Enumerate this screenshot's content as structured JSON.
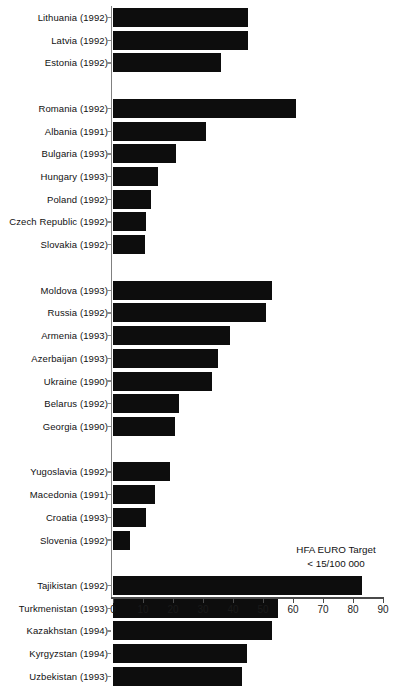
{
  "chart_data": {
    "type": "bar",
    "orientation": "horizontal",
    "title": "",
    "xlabel": "",
    "ylabel": "",
    "xlim": [
      0,
      90
    ],
    "xticks": [
      0,
      10,
      20,
      30,
      40,
      50,
      60,
      70,
      80,
      90
    ],
    "grid": false,
    "legend": "none",
    "bar_color": "#0d0d0d",
    "categories": [
      "Lithuania (1992)",
      "Latvia (1992)",
      "Estonia (1992)",
      "Romania (1992)",
      "Albania (1991)",
      "Bulgaria (1993)",
      "Hungary (1993)",
      "Poland (1992)",
      "Czech Republic (1992)",
      "Slovakia (1992)",
      "Moldova (1993)",
      "Russia (1992)",
      "Armenia (1993)",
      "Azerbaijan (1993)",
      "Ukraine (1990)",
      "Belarus (1992)",
      "Georgia (1990)",
      "Yugoslavia (1992)",
      "Macedonia (1991)",
      "Croatia (1993)",
      "Slovenia (1992)",
      "Tajikistan (1992)",
      "Turkmenistan (1993)",
      "Kazakhstan (1994)",
      "Kyrgyzstan (1994)",
      "Uzbekistan (1993)"
    ],
    "values": [
      45,
      45,
      36,
      61,
      31,
      21,
      15,
      12.5,
      11,
      10.5,
      53,
      51,
      39,
      35,
      33,
      22,
      20.5,
      19,
      14,
      11,
      5.5,
      83,
      55,
      53,
      44.5,
      43
    ],
    "groups": [
      {
        "name": "Baltic states",
        "start": 0,
        "count": 3
      },
      {
        "name": "Central and eastern Europe",
        "start": 3,
        "count": 7
      },
      {
        "name": "Commonwealth of Independent States (European)",
        "start": 10,
        "count": 7
      },
      {
        "name": "Former Yugoslavia",
        "start": 17,
        "count": 4
      },
      {
        "name": "Central Asian republics",
        "start": 21,
        "count": 5
      }
    ],
    "annotations": [
      {
        "line1": "HFA EURO Target",
        "line2": "< 15/100 000"
      }
    ]
  },
  "annotation": {
    "line1": "HFA EURO Target",
    "line2": "< 15/100 000"
  }
}
